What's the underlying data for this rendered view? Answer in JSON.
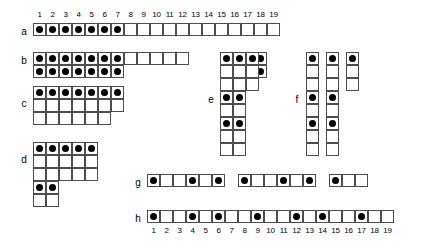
{
  "figure": {
    "cell_size_px": 13,
    "dot_color": "#000000",
    "line_color": "#4d4d4d",
    "background": "#ffffff",
    "columns": 19
  },
  "ruler_top": {
    "name": "column-numbers-top",
    "ticks": [
      "1",
      "2",
      "3",
      "4",
      "5",
      "6",
      "7",
      "8",
      "9",
      "10",
      "11",
      "12",
      "13",
      "14",
      "15",
      "16",
      "17",
      "18",
      "19"
    ]
  },
  "ruler_bottom": {
    "name": "column-numbers-bottom",
    "ticks": [
      "1",
      "2",
      "3",
      "4",
      "5",
      "6",
      "7",
      "8",
      "9",
      "10",
      "11",
      "12",
      "13",
      "14",
      "15",
      "16",
      "17",
      "18",
      "19"
    ]
  },
  "rows": [
    {
      "label": "a",
      "kind": "single-row",
      "cols": 19,
      "filled_columns": [
        1,
        2,
        3,
        4,
        5,
        6,
        7
      ],
      "grid": [
        [
          1,
          1,
          1,
          1,
          1,
          1,
          1,
          0,
          0,
          0,
          0,
          0,
          0,
          0,
          0,
          0,
          0,
          0,
          0
        ]
      ]
    },
    {
      "label": "b",
      "kind": "block",
      "cols": 19,
      "rows_count": 2,
      "grid": [
        [
          1,
          1,
          1,
          1,
          1,
          1,
          1,
          0,
          0,
          0,
          0,
          0,
          -1,
          -1,
          -1,
          1,
          1,
          1,
          -1
        ],
        [
          1,
          1,
          1,
          1,
          1,
          1,
          1,
          -1,
          -1,
          -1,
          -1,
          -1,
          -1,
          -1,
          -1,
          1,
          1,
          1,
          -1
        ]
      ],
      "filled_columns_top": [
        1,
        2,
        3,
        4,
        5,
        6,
        7,
        16,
        17,
        18
      ]
    },
    {
      "label": "c",
      "kind": "block",
      "cols": 7,
      "rows_count": 3,
      "grid": [
        [
          1,
          1,
          1,
          1,
          1,
          1,
          1
        ],
        [
          0,
          0,
          0,
          0,
          0,
          0,
          0
        ],
        [
          0,
          0,
          0,
          0,
          0,
          0,
          -1
        ]
      ],
      "filled_columns_top": [
        1,
        2,
        3,
        4,
        5,
        6,
        7
      ]
    },
    {
      "label": "d",
      "kind": "block",
      "cols": 5,
      "rows_count": 5,
      "grid": [
        [
          1,
          1,
          1,
          1,
          1
        ],
        [
          0,
          0,
          0,
          0,
          0
        ],
        [
          0,
          0,
          0,
          0,
          0
        ],
        [
          1,
          1,
          -1,
          -1,
          -1
        ],
        [
          0,
          0,
          -1,
          -1,
          -1
        ]
      ],
      "filled_columns_top": [
        1,
        2,
        3,
        4,
        5
      ]
    },
    {
      "label": "e",
      "kind": "block",
      "cols": 3,
      "rows_count": 8,
      "grid": [
        [
          1,
          1,
          1
        ],
        [
          0,
          0,
          0
        ],
        [
          0,
          0,
          0
        ],
        [
          1,
          1,
          -1
        ],
        [
          0,
          0,
          -1
        ],
        [
          1,
          1,
          -1
        ],
        [
          0,
          0,
          -1
        ],
        [
          0,
          0,
          -1
        ]
      ]
    },
    {
      "label": "f",
      "kind": "columns",
      "cols": 3,
      "rows_count": 8,
      "grid": [
        [
          1,
          1,
          1
        ],
        [
          0,
          0,
          0
        ],
        [
          0,
          0,
          0
        ],
        [
          1,
          1,
          -1
        ],
        [
          0,
          0,
          -1
        ],
        [
          1,
          1,
          -1
        ],
        [
          0,
          0,
          -1
        ],
        [
          0,
          0,
          -1
        ]
      ]
    },
    {
      "label": "g",
      "kind": "segmented-row",
      "segments": [
        {
          "cells": [
            1,
            0,
            0,
            1,
            0,
            1
          ]
        },
        {
          "cells": [
            1,
            0,
            0,
            1,
            0,
            1
          ]
        },
        {
          "cells": [
            1,
            0,
            0
          ]
        }
      ],
      "gap_cells": 1
    },
    {
      "label": "h",
      "kind": "single-row",
      "cols": 19,
      "filled_columns": [
        1,
        4,
        6,
        9,
        12,
        14,
        17
      ],
      "grid": [
        [
          1,
          0,
          0,
          1,
          0,
          1,
          0,
          0,
          1,
          0,
          0,
          1,
          0,
          1,
          0,
          0,
          1,
          0,
          0
        ]
      ]
    }
  ]
}
